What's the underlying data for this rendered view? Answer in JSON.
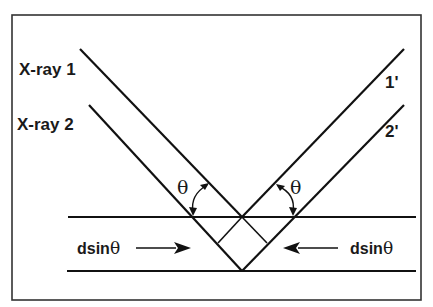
{
  "diagram": {
    "labels": {
      "xray1": "X-ray 1",
      "xray2": "X-ray 2",
      "reflected1": "1'",
      "reflected2": "2'",
      "theta_left": "θ",
      "theta_right": "θ",
      "path_left_prefix": "dsin",
      "path_left_theta": "θ",
      "path_right_prefix": "dsin",
      "path_right_theta": "θ"
    },
    "colors": {
      "line": "#111111",
      "frame": "#333333",
      "background": "#ffffff"
    },
    "elements": [
      "incident ray X-ray 1",
      "incident ray X-ray 2",
      "reflected ray 1'",
      "reflected ray 2'",
      "upper atomic plane",
      "lower atomic plane",
      "angle theta (incident)",
      "angle theta (reflected)",
      "path difference dsinθ (left)",
      "path difference dsinθ (right)"
    ]
  }
}
